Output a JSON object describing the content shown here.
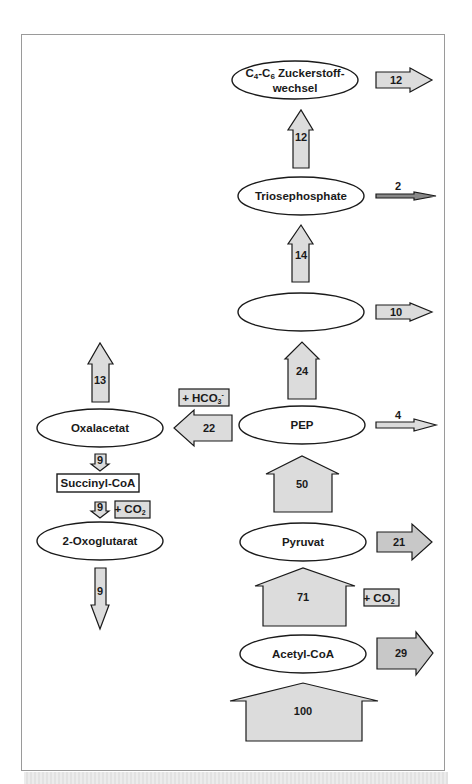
{
  "nodes": {
    "sugar_metabolism": {
      "line1_c4": "C",
      "line1_sub4": "4",
      "line1_dash": "-C",
      "line1_sub6": "6",
      "line1_rest": " Zuckerstoff-",
      "line2": "wechsel"
    },
    "triosephosphate": "Triosephosphate",
    "phosphoglycerate": "3-Phosphoglycerat",
    "pep": "PEP",
    "oxalacetat": "Oxalacetat",
    "succinyl_coa": "Succinyl-CoA",
    "oxoglutarat": "2-Oxoglutarat",
    "pyruvat": "Pyruvat",
    "acetyl_coa": "Acetyl-CoA"
  },
  "fluxes": {
    "input_to_acetyl_coa": "100",
    "acetyl_coa_out": "29",
    "acetyl_coa_to_pyruvat": "71",
    "pyruvat_out": "21",
    "pyruvat_to_pep": "50",
    "pep_out": "4",
    "pep_to_oxalacetat": "22",
    "pep_to_phosphoglycerat": "24",
    "phosphoglycerat_out": "10",
    "phosphoglycerat_to_triose": "14",
    "triose_out": "2",
    "triose_to_sugar": "12",
    "sugar_out": "12",
    "oxalacetat_up": "13",
    "oxalacetat_to_succinyl": "9",
    "succinyl_to_oxoglutarat": "9",
    "oxoglutarat_out": "9"
  },
  "cofactors": {
    "hco3": {
      "main": "+ HCO",
      "sub": "3",
      "sup": "-"
    },
    "co2_tca": {
      "main": "+ CO",
      "sub": "2"
    },
    "co2_pyruvat": {
      "main": "+ CO",
      "sub": "2"
    }
  }
}
